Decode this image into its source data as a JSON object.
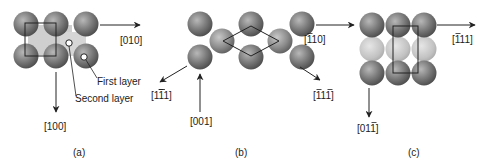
{
  "figure": {
    "panels": [
      {
        "caption": "(a)",
        "directions": {
          "right": {
            "open": "[",
            "digits": [
              "0",
              "1",
              "0"
            ],
            "bars": [
              false,
              false,
              false
            ],
            "close": "]"
          },
          "down": {
            "open": "[",
            "digits": [
              "1",
              "0",
              "0"
            ],
            "bars": [
              false,
              false,
              false
            ],
            "close": "]"
          }
        },
        "annotations": {
          "first_layer": "First layer",
          "second_layer": "Second layer"
        }
      },
      {
        "caption": "(b)",
        "directions": {
          "lower_left": {
            "open": "[",
            "digits": [
              "1",
              "1",
              "1"
            ],
            "bars": [
              false,
              true,
              false
            ],
            "close": "]"
          },
          "up": {
            "open": "[",
            "digits": [
              "0",
              "0",
              "1"
            ],
            "bars": [
              false,
              false,
              false
            ],
            "close": "]"
          },
          "right": {
            "open": "[",
            "digits": [
              "1",
              "1",
              "0"
            ],
            "bars": [
              true,
              false,
              false
            ],
            "close": "]"
          },
          "lower_right": {
            "open": "[",
            "digits": [
              "1",
              "1",
              "1"
            ],
            "bars": [
              true,
              false,
              true
            ],
            "close": "]"
          }
        }
      },
      {
        "caption": "(c)",
        "directions": {
          "right": {
            "open": "[",
            "digits": [
              "1",
              "1",
              "1"
            ],
            "bars": [
              true,
              false,
              false
            ],
            "close": "]"
          },
          "down": {
            "open": "[",
            "digits": [
              "0",
              "1",
              "1"
            ],
            "bars": [
              false,
              false,
              true
            ],
            "close": "]"
          }
        }
      }
    ],
    "colors": {
      "sphere_dark": "#6f6f6f",
      "sphere_light": "#c4c4c4",
      "line": "#222222"
    }
  }
}
